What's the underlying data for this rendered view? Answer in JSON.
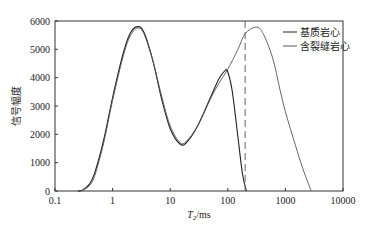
{
  "chart_data": {
    "type": "line",
    "title": "",
    "xlabel": "T2/ms",
    "xlabel_main": "T",
    "xlabel_sub": "2",
    "xlabel_unit": "/ms",
    "ylabel": "信号幅度",
    "xscale": "log",
    "xlim": [
      0.1,
      10000
    ],
    "ylim": [
      0,
      6000
    ],
    "x_ticks": [
      0.1,
      1,
      10,
      100,
      1000,
      10000
    ],
    "x_tick_labels": [
      "0.1",
      "1",
      "10",
      "100",
      "1000",
      "10000"
    ],
    "y_ticks": [
      0,
      1000,
      2000,
      3000,
      4000,
      5000,
      6000
    ],
    "y_tick_labels": [
      "0",
      "1000",
      "2000",
      "3000",
      "4000",
      "5000",
      "6000"
    ],
    "grid": false,
    "legend_position": "upper right",
    "annotations": [
      {
        "type": "vertical-dashed-line",
        "x": 200
      }
    ],
    "series": [
      {
        "name": "基质岩心",
        "color": "#222222",
        "x": [
          0.25,
          0.3,
          0.4,
          0.5,
          0.7,
          1.0,
          1.5,
          2.0,
          2.7,
          3.5,
          5,
          7,
          10,
          15,
          20,
          30,
          50,
          70,
          90,
          100,
          120,
          150,
          180,
          210
        ],
        "y": [
          0,
          30,
          250,
          700,
          1800,
          3300,
          4800,
          5550,
          5800,
          5600,
          4600,
          3300,
          2200,
          1650,
          1750,
          2300,
          3300,
          3950,
          4250,
          4200,
          3500,
          1900,
          600,
          0
        ]
      },
      {
        "name": "含裂缝岩心",
        "color": "#555555",
        "x": [
          0.25,
          0.3,
          0.4,
          0.5,
          0.7,
          1.0,
          1.5,
          2.0,
          2.7,
          3.5,
          5,
          7,
          10,
          15,
          20,
          30,
          50,
          70,
          100,
          150,
          200,
          300,
          400,
          600,
          800,
          1000,
          1500,
          2000,
          2800
        ],
        "y": [
          0,
          20,
          200,
          600,
          1700,
          3200,
          4700,
          5450,
          5750,
          5550,
          4600,
          3400,
          2300,
          1700,
          1800,
          2300,
          3250,
          3800,
          4300,
          5000,
          5550,
          5780,
          5600,
          4700,
          3600,
          2800,
          1600,
          800,
          0
        ]
      }
    ]
  }
}
